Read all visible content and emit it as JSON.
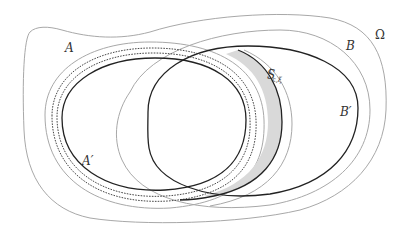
{
  "diagram": {
    "labels": {
      "omega": "Ω",
      "A": "A",
      "A_prime": "A′",
      "B": "B",
      "B_prime": "B′",
      "S_base": "S",
      "S_sup": "t",
      "S_sub": "ε,ξ"
    },
    "colors": {
      "background": "#ffffff",
      "light_curve": "#a8a8a8",
      "dark_curve": "#222222",
      "dashed_curve": "#333333",
      "shaded_band": "#d9d9d9",
      "label": "#333333"
    }
  }
}
